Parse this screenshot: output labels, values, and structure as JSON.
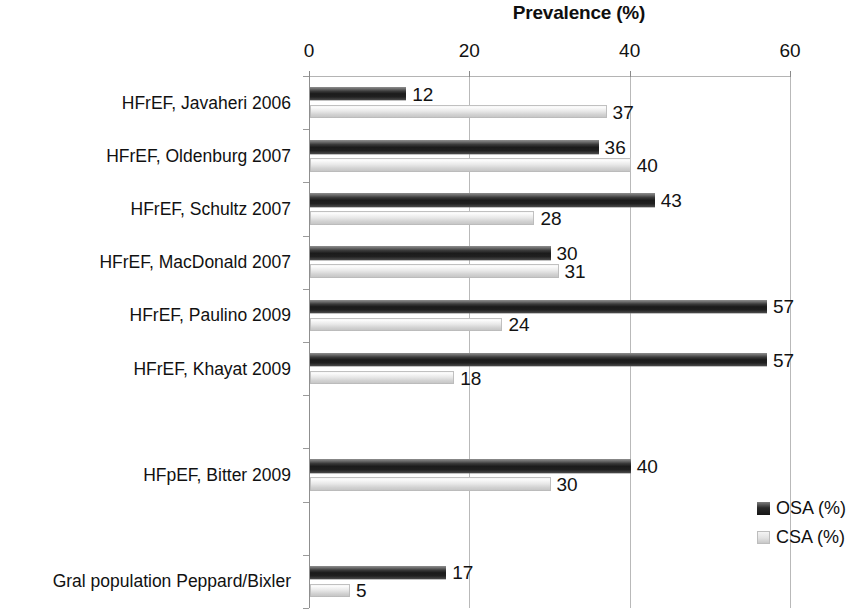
{
  "chart_data": {
    "type": "bar",
    "orientation": "horizontal",
    "title": "Prevalence (%)",
    "xlabel": "",
    "ylabel": "",
    "xlim": [
      0,
      60
    ],
    "xticks": [
      0,
      20,
      40,
      60
    ],
    "grid": true,
    "grid_axis": "x",
    "legend_position": "right",
    "categories": [
      "HFrEF, Javaheri 2006",
      "HFrEF, Oldenburg 2007",
      "HFrEF, Schultz 2007",
      "HFrEF, MacDonald 2007",
      "HFrEF, Paulino 2009",
      "HFrEF, Khayat 2009",
      "",
      "HFpEF,  Bitter 2009",
      "",
      "Gral population Peppard/Bixler"
    ],
    "series": [
      {
        "name": "OSA (%)",
        "color": "#1f1f1f",
        "values": [
          12,
          36,
          43,
          30,
          57,
          57,
          null,
          40,
          null,
          17
        ]
      },
      {
        "name": "CSA (%)",
        "color": "#e6e6e6",
        "values": [
          37,
          40,
          28,
          31,
          24,
          18,
          null,
          30,
          null,
          5
        ]
      }
    ]
  },
  "axis": {
    "tick_labels": [
      "0",
      "20",
      "40",
      "60"
    ]
  },
  "legend": {
    "items": [
      {
        "label": "OSA (%)",
        "swatch": "dark-swatch-icon"
      },
      {
        "label": "CSA (%)",
        "swatch": "light-swatch-icon"
      }
    ]
  }
}
